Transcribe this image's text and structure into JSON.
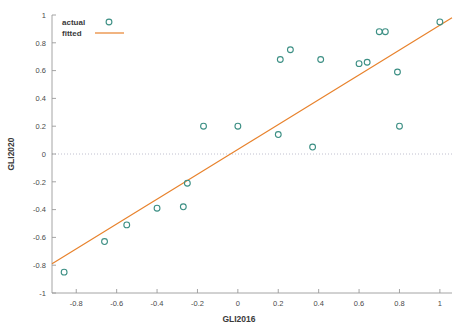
{
  "chart_data": {
    "type": "scatter",
    "title": "",
    "xlabel": "GLI2016",
    "ylabel": "GLI2020",
    "xlim": [
      -0.92,
      1.06
    ],
    "ylim": [
      -1.0,
      1.0
    ],
    "xticks": [
      -0.8,
      -0.6,
      -0.4,
      -0.2,
      0,
      0.2,
      0.4,
      0.6,
      0.8,
      1
    ],
    "xticklabels": [
      "-0.8",
      "-0.6",
      "-0.4",
      "-0.2",
      "0",
      "0.2",
      "0.4",
      "0.6",
      "0.8",
      "1"
    ],
    "yticks": [
      -1,
      -0.8,
      -0.6,
      -0.4,
      -0.2,
      0,
      0.2,
      0.4,
      0.6,
      0.8,
      1
    ],
    "yticklabels": [
      "-1",
      "-0.8",
      "-0.6",
      "-0.4",
      "-0.2",
      "0",
      "0.2",
      "0.4",
      "0.6",
      "0.8",
      "1"
    ],
    "grid": false,
    "zero_line": {
      "y": 0,
      "style": "dotted",
      "color": "#b9b9c9"
    },
    "legend": {
      "position": "top-left",
      "entries": [
        {
          "label": "actual",
          "marker": "circle",
          "color": "#3c8f84"
        },
        {
          "label": "fitted",
          "marker": "line",
          "color": "#e8822c"
        }
      ]
    },
    "series": [
      {
        "name": "actual",
        "marker": "circle",
        "color": "#3c8f84",
        "points": [
          {
            "x": -0.86,
            "y": -0.85
          },
          {
            "x": -0.66,
            "y": -0.63
          },
          {
            "x": -0.55,
            "y": -0.51
          },
          {
            "x": -0.4,
            "y": -0.39
          },
          {
            "x": -0.27,
            "y": -0.38
          },
          {
            "x": -0.25,
            "y": -0.21
          },
          {
            "x": -0.17,
            "y": 0.2
          },
          {
            "x": 0.0,
            "y": 0.2
          },
          {
            "x": 0.2,
            "y": 0.14
          },
          {
            "x": 0.21,
            "y": 0.68
          },
          {
            "x": 0.26,
            "y": 0.75
          },
          {
            "x": 0.37,
            "y": 0.05
          },
          {
            "x": 0.41,
            "y": 0.68
          },
          {
            "x": 0.6,
            "y": 0.65
          },
          {
            "x": 0.64,
            "y": 0.66
          },
          {
            "x": 0.7,
            "y": 0.88
          },
          {
            "x": 0.73,
            "y": 0.88
          },
          {
            "x": 0.79,
            "y": 0.59
          },
          {
            "x": 0.8,
            "y": 0.2
          },
          {
            "x": 1.0,
            "y": 0.95
          }
        ]
      },
      {
        "name": "fitted",
        "type": "line",
        "color": "#e8822c",
        "endpoints": [
          {
            "x": -0.92,
            "y": -0.79
          },
          {
            "x": 1.06,
            "y": 0.98
          }
        ]
      }
    ]
  }
}
